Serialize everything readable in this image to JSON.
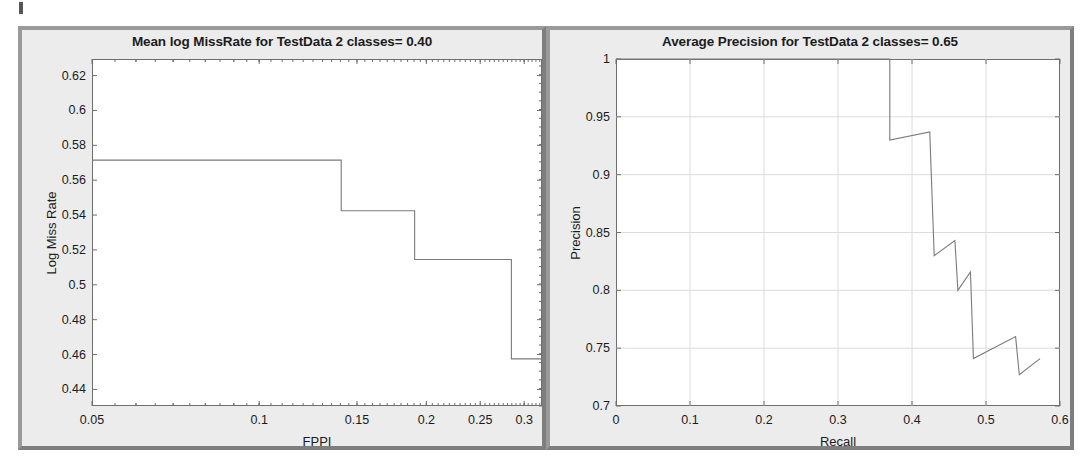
{
  "figure": {
    "background_color": "#ffffff",
    "panel_face_color": "#ececed",
    "panel_border_color": "#8b8b8b",
    "axes_background": "#ffffff",
    "axes_border_color": "#6e6e6e",
    "line_color": "#7a7a7a",
    "grid_color": "#dcdcdc",
    "text_color": "#1b1b1b"
  },
  "chart_data": [
    {
      "type": "line",
      "panel": "left",
      "title": "Mean log MissRate for TestData 2 classes= 0.40",
      "xlabel": "FPPI",
      "ylabel": "Log Miss Rate",
      "xscale": "log",
      "yscale": "linear",
      "xlim": [
        0.05,
        0.323
      ],
      "ylim": [
        0.4305,
        0.6295
      ],
      "grid": false,
      "xticks": [
        0.05,
        0.1,
        0.15,
        0.2,
        0.25,
        0.3
      ],
      "xticklabels": [
        "0.05",
        "0.1",
        "0.15",
        "0.2",
        "0.25",
        "0.3"
      ],
      "yticks": [
        0.44,
        0.46,
        0.48,
        0.5,
        0.52,
        0.54,
        0.56,
        0.58,
        0.6,
        0.62
      ],
      "yticklabels": [
        "0.44",
        "0.46",
        "0.48",
        "0.5",
        "0.52",
        "0.54",
        "0.56",
        "0.58",
        "0.6",
        "0.62"
      ],
      "drawstyle": "steps-post",
      "series": [
        {
          "name": "Log Miss Rate",
          "x": [
            0.05,
            0.1405,
            0.1405,
            0.1905,
            0.1905,
            0.2845,
            0.2845,
            0.323
          ],
          "y": [
            0.5715,
            0.5715,
            0.5425,
            0.5425,
            0.5145,
            0.5145,
            0.4575,
            0.4575
          ]
        }
      ],
      "annotations": {
        "mean_log_miss_rate": "0.40"
      }
    },
    {
      "type": "line",
      "panel": "right",
      "title": "Average Precision for TestData 2 classes= 0.65",
      "xlabel": "Recall",
      "ylabel": "Precision",
      "xscale": "linear",
      "yscale": "linear",
      "xlim": [
        0.0,
        0.6
      ],
      "ylim": [
        0.7,
        1.0
      ],
      "grid": true,
      "xticks": [
        0,
        0.1,
        0.2,
        0.3,
        0.4,
        0.5,
        0.6
      ],
      "xticklabels": [
        "0",
        "0.1",
        "0.2",
        "0.3",
        "0.4",
        "0.5",
        "0.6"
      ],
      "yticks": [
        0.7,
        0.75,
        0.8,
        0.85,
        0.9,
        0.95,
        1.0
      ],
      "yticklabels": [
        "0.7",
        "0.75",
        "0.8",
        "0.85",
        "0.9",
        "0.95",
        "1"
      ],
      "drawstyle": "sawtooth",
      "series": [
        {
          "name": "Precision-Recall",
          "x": [
            0.0,
            0.37,
            0.37,
            0.424,
            0.424,
            0.43,
            0.43,
            0.458,
            0.458,
            0.462,
            0.462,
            0.479,
            0.479,
            0.483,
            0.483,
            0.54,
            0.54,
            0.545,
            0.545,
            0.573
          ],
          "y": [
            1.0,
            1.0,
            0.93,
            0.937,
            0.937,
            0.83,
            0.83,
            0.843,
            0.843,
            0.8,
            0.8,
            0.816,
            0.816,
            0.741,
            0.741,
            0.76,
            0.76,
            0.727,
            0.727,
            0.741
          ]
        }
      ],
      "annotations": {
        "average_precision": "0.65"
      }
    }
  ]
}
